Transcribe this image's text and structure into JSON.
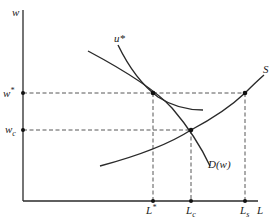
{
  "diagram": {
    "axes": {
      "y_label": "w",
      "x_label": "L"
    },
    "wage_levels": {
      "w_star": {
        "label": "w",
        "sup": "*"
      },
      "w_c": {
        "label": "w",
        "sub": "c"
      }
    },
    "employment_levels": {
      "L_star": {
        "label": "L",
        "sup": "*"
      },
      "L_c": {
        "label": "L",
        "sub": "c"
      },
      "L_s": {
        "label": "L",
        "sub": "s"
      }
    },
    "curves": {
      "u_star": {
        "label": "u*"
      },
      "demand": {
        "label": "D(w)"
      },
      "supply": {
        "label": "S"
      }
    },
    "colors": {
      "line": "#2a2a2a",
      "dash": "#444444",
      "background": "#ffffff"
    }
  }
}
